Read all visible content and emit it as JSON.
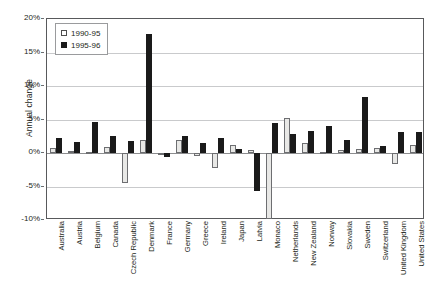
{
  "chart_data": {
    "type": "bar",
    "title": "",
    "xlabel": "",
    "ylabel": "Annual change",
    "ylim": [
      -10,
      20
    ],
    "yticks": [
      "-10%",
      "-5%",
      "0%",
      "5%",
      "10%",
      "15%",
      "20%"
    ],
    "ytick_values": [
      -10,
      -5,
      0,
      5,
      10,
      15,
      20
    ],
    "grid": true,
    "legend_position": "top-left",
    "unit": "percent",
    "categories": [
      "Australia",
      "Austria",
      "Belgium",
      "Canada",
      "Czech Republic",
      "Denmark",
      "France",
      "Germany",
      "Greece",
      "Ireland",
      "Japan",
      "Latvia",
      "Monaco",
      "Netherlands",
      "New Zealand",
      "Norway",
      "Slovakia",
      "Sweden",
      "Switzerland",
      "United Kingdom",
      "United States"
    ],
    "series": [
      {
        "name": "1990-95",
        "color": "#e8e8e6",
        "values": [
          0.8,
          0.3,
          0.2,
          0.9,
          -4.5,
          1.9,
          0.0,
          2.0,
          -0.4,
          -2.3,
          1.2,
          0.5,
          -9.8,
          5.2,
          1.5,
          0.2,
          0.4,
          0.6,
          0.7,
          -1.6,
          1.2
        ]
      },
      {
        "name": "1995-96",
        "color": "#1a1a1a",
        "values": [
          2.3,
          1.6,
          4.6,
          2.6,
          1.8,
          17.8,
          -0.6,
          2.5,
          1.5,
          2.2,
          0.6,
          -5.7,
          4.5,
          2.8,
          3.3,
          4.0,
          1.9,
          8.3,
          1.1,
          3.1,
          3.2
        ]
      }
    ]
  },
  "legend": {
    "entries": [
      {
        "label": "1990-95",
        "style": "light"
      },
      {
        "label": "1995-96",
        "style": "dark"
      }
    ]
  }
}
